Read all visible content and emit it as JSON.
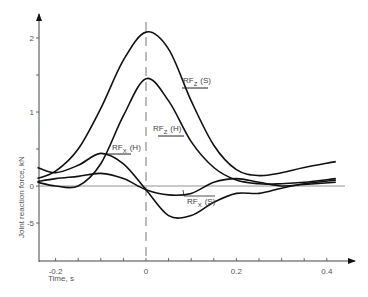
{
  "chart_data": {
    "type": "line",
    "title": "",
    "xlabel": "Time, s",
    "ylabel": "Joint reaction force, kN",
    "xlim": [
      -0.24,
      0.45
    ],
    "ylim": [
      -0.8,
      2.3
    ],
    "grid": false,
    "legend_position": "inline labels",
    "x_ticks": [
      -0.2,
      0,
      0.2,
      0.4
    ],
    "x_tick_labels": [
      "-0.2",
      "0",
      "0.2",
      "0.4"
    ],
    "y_ticks": [
      2,
      1,
      0,
      -0.5
    ],
    "y_tick_labels": [
      "2",
      "1",
      "0",
      "-5"
    ],
    "annotations": [
      "vertical dashed line at t = 0",
      "horizontal reference line at 0"
    ],
    "series": [
      {
        "name": "RFz (S)",
        "label_main": "RF",
        "label_sub": "Z",
        "label_suffix": "(S)",
        "x": [
          -0.24,
          -0.2,
          -0.15,
          -0.1,
          -0.05,
          0,
          0.05,
          0.1,
          0.15,
          0.2,
          0.25,
          0.3,
          0.35,
          0.42
        ],
        "values": [
          0.1,
          0.2,
          0.5,
          1.05,
          1.7,
          2.08,
          1.85,
          1.15,
          0.55,
          0.22,
          0.14,
          0.18,
          0.25,
          0.33
        ]
      },
      {
        "name": "RFz (H)",
        "label_main": "RF",
        "label_sub": "Z",
        "label_suffix": "(H)",
        "x": [
          -0.24,
          -0.2,
          -0.15,
          -0.1,
          -0.05,
          0,
          0.05,
          0.1,
          0.15,
          0.2,
          0.25,
          0.3,
          0.35,
          0.42
        ],
        "values": [
          0.05,
          0.0,
          0.0,
          0.3,
          0.95,
          1.45,
          1.15,
          0.6,
          0.25,
          0.08,
          0.03,
          0.03,
          0.05,
          0.1
        ]
      },
      {
        "name": "RFx (H)",
        "label_main": "RF",
        "label_sub": "X",
        "label_suffix": "(H)",
        "x": [
          -0.24,
          -0.2,
          -0.15,
          -0.1,
          -0.05,
          0,
          0.05,
          0.1,
          0.15,
          0.2,
          0.25,
          0.3,
          0.35,
          0.42
        ],
        "values": [
          0.25,
          0.18,
          0.28,
          0.44,
          0.3,
          -0.05,
          -0.4,
          -0.4,
          -0.22,
          -0.1,
          -0.1,
          -0.03,
          0.03,
          0.08
        ]
      },
      {
        "name": "RFx (S)",
        "label_main": "RF",
        "label_sub": "X",
        "label_suffix": "(S)",
        "x": [
          -0.24,
          -0.2,
          -0.15,
          -0.1,
          -0.05,
          0,
          0.05,
          0.1,
          0.15,
          0.2,
          0.25,
          0.3,
          0.35,
          0.42
        ],
        "values": [
          0.06,
          0.1,
          0.13,
          0.17,
          0.1,
          -0.05,
          -0.12,
          -0.1,
          0.05,
          0.1,
          0.05,
          0.0,
          0.02,
          0.05
        ]
      }
    ]
  }
}
